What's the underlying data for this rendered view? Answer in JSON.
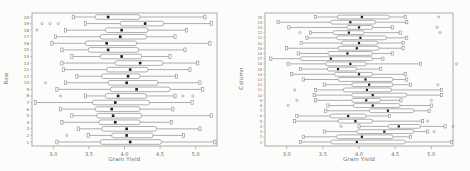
{
  "style": {
    "line_color": "#8c8c8c",
    "median_color": "#1c1c1c",
    "text_color": "#6e6e6e",
    "frame_color": "#9a9a9a",
    "box_fill": "#ffffff",
    "background": "#fcfcfb"
  },
  "chart_data": [
    {
      "type": "boxplot",
      "orientation": "horizontal",
      "xlabel": "Grain Yield",
      "ylabel": "Row",
      "xlim": [
        2.7,
        5.3
      ],
      "xticks": [
        3.0,
        3.5,
        4.0,
        4.5,
        5.0
      ],
      "categories": [
        1,
        2,
        3,
        4,
        5,
        6,
        7,
        8,
        9,
        10,
        11,
        12,
        13,
        14,
        15,
        16,
        17,
        18,
        19,
        20
      ],
      "boxes": [
        {
          "cat": 1,
          "lo": 3.05,
          "q1": 3.66,
          "med": 4.08,
          "q3": 4.52,
          "hi": 5.27,
          "outliers": []
        },
        {
          "cat": 2,
          "lo": 3.49,
          "q1": 3.82,
          "med": 4.03,
          "q3": 4.4,
          "hi": 4.83,
          "outliers": [
            3.19
          ]
        },
        {
          "cat": 3,
          "lo": 3.35,
          "q1": 3.68,
          "med": 4.03,
          "q3": 4.45,
          "hi": 5.06,
          "outliers": []
        },
        {
          "cat": 4,
          "lo": 3.12,
          "q1": 3.64,
          "med": 3.87,
          "q3": 4.22,
          "hi": 4.66,
          "outliers": []
        },
        {
          "cat": 5,
          "lo": 3.26,
          "q1": 3.61,
          "med": 3.84,
          "q3": 4.24,
          "hi": 5.22,
          "outliers": []
        },
        {
          "cat": 6,
          "lo": 3.1,
          "q1": 3.59,
          "med": 3.82,
          "q3": 4.22,
          "hi": 4.68,
          "outliers": []
        },
        {
          "cat": 7,
          "lo": 2.75,
          "q1": 3.55,
          "med": 3.87,
          "q3": 4.35,
          "hi": 4.95,
          "outliers": []
        },
        {
          "cat": 8,
          "lo": 3.45,
          "q1": 3.73,
          "med": 3.91,
          "q3": 4.31,
          "hi": 4.71,
          "outliers": [
            3.1,
            4.82,
            4.96
          ]
        },
        {
          "cat": 9,
          "lo": 3.05,
          "q1": 3.8,
          "med": 4.17,
          "q3": 4.64,
          "hi": 5.1,
          "outliers": []
        },
        {
          "cat": 10,
          "lo": 3.17,
          "q1": 3.77,
          "med": 4.03,
          "q3": 4.47,
          "hi": 5.06,
          "outliers": [
            2.89
          ]
        },
        {
          "cat": 11,
          "lo": 3.33,
          "q1": 3.68,
          "med": 4.05,
          "q3": 4.22,
          "hi": 4.73,
          "outliers": []
        },
        {
          "cat": 12,
          "lo": 3.14,
          "q1": 3.75,
          "med": 4.08,
          "q3": 4.33,
          "hi": 4.92,
          "outliers": []
        },
        {
          "cat": 13,
          "lo": 3.12,
          "q1": 3.87,
          "med": 4.22,
          "q3": 4.54,
          "hi": 5.03,
          "outliers": []
        },
        {
          "cat": 14,
          "lo": 3.26,
          "q1": 3.66,
          "med": 3.96,
          "q3": 4.24,
          "hi": 4.64,
          "outliers": []
        },
        {
          "cat": 15,
          "lo": 3.12,
          "q1": 3.49,
          "med": 3.77,
          "q3": 4.2,
          "hi": 4.85,
          "outliers": []
        },
        {
          "cat": 16,
          "lo": 2.98,
          "q1": 3.45,
          "med": 3.75,
          "q3": 4.17,
          "hi": 5.2,
          "outliers": []
        },
        {
          "cat": 17,
          "lo": 3.03,
          "q1": 3.66,
          "med": 3.94,
          "q3": 4.31,
          "hi": 4.71,
          "outliers": []
        },
        {
          "cat": 18,
          "lo": 3.17,
          "q1": 3.73,
          "med": 3.96,
          "q3": 4.33,
          "hi": 4.87,
          "outliers": [
            2.77
          ]
        },
        {
          "cat": 19,
          "lo": 3.45,
          "q1": 3.94,
          "med": 4.29,
          "q3": 4.55,
          "hi": 5.22,
          "outliers": [
            2.84,
            2.95,
            3.07
          ]
        },
        {
          "cat": 20,
          "lo": 3.28,
          "q1": 3.59,
          "med": 3.77,
          "q3": 4.22,
          "hi": 5.13,
          "outliers": []
        }
      ]
    },
    {
      "type": "boxplot",
      "orientation": "horizontal",
      "xlabel": "Grain Yield",
      "ylabel": "Column",
      "xlim": [
        2.7,
        5.3
      ],
      "xticks": [
        3.0,
        3.5,
        4.0,
        4.5,
        5.0
      ],
      "categories": [
        1,
        2,
        3,
        4,
        5,
        6,
        7,
        8,
        9,
        10,
        11,
        12,
        13,
        14,
        15,
        16,
        17,
        18,
        19,
        20,
        21,
        22,
        23,
        24,
        25
      ],
      "boxes": [
        {
          "cat": 1,
          "lo": 3.19,
          "q1": 3.61,
          "med": 3.97,
          "q3": 4.64,
          "hi": 5.28,
          "outliers": []
        },
        {
          "cat": 2,
          "lo": 3.23,
          "q1": 3.69,
          "med": 4.04,
          "q3": 4.47,
          "hi": 4.71,
          "outliers": []
        },
        {
          "cat": 3,
          "lo": 3.52,
          "q1": 3.97,
          "med": 4.35,
          "q3": 4.76,
          "hi": 4.95,
          "outliers": [
            5.04
          ]
        },
        {
          "cat": 4,
          "lo": 4.0,
          "q1": 4.4,
          "med": 4.55,
          "q3": 4.85,
          "hi": 5.19,
          "outliers": [
            3.75,
            5.3
          ]
        },
        {
          "cat": 5,
          "lo": 3.11,
          "q1": 3.71,
          "med": 3.95,
          "q3": 4.19,
          "hi": 4.88,
          "outliers": [
            4.95
          ]
        },
        {
          "cat": 6,
          "lo": 3.14,
          "q1": 3.6,
          "med": 3.85,
          "q3": 4.1,
          "hi": 4.42,
          "outliers": []
        },
        {
          "cat": 7,
          "lo": 3.54,
          "q1": 4.14,
          "med": 4.4,
          "q3": 4.76,
          "hi": 4.97,
          "outliers": []
        },
        {
          "cat": 8,
          "lo": 3.57,
          "q1": 3.92,
          "med": 4.19,
          "q3": 4.57,
          "hi": 5.0,
          "outliers": [
            3.02
          ]
        },
        {
          "cat": 9,
          "lo": 3.4,
          "q1": 3.9,
          "med": 4.1,
          "q3": 4.3,
          "hi": 4.58,
          "outliers": [
            3.14,
            5.0
          ]
        },
        {
          "cat": 10,
          "lo": 3.38,
          "q1": 3.9,
          "med": 4.19,
          "q3": 4.66,
          "hi": 5.14,
          "outliers": []
        },
        {
          "cat": 11,
          "lo": 3.4,
          "q1": 3.78,
          "med": 4.11,
          "q3": 4.45,
          "hi": 5.14,
          "outliers": [
            3.11
          ]
        },
        {
          "cat": 12,
          "lo": 3.52,
          "q1": 3.9,
          "med": 4.14,
          "q3": 4.47,
          "hi": 4.71,
          "outliers": [
            5.09
          ]
        },
        {
          "cat": 13,
          "lo": 3.23,
          "q1": 3.71,
          "med": 4.09,
          "q3": 4.47,
          "hi": 4.66,
          "outliers": []
        },
        {
          "cat": 14,
          "lo": 3.07,
          "q1": 3.66,
          "med": 4.0,
          "q3": 4.19,
          "hi": 4.64,
          "outliers": []
        },
        {
          "cat": 15,
          "lo": 3.19,
          "q1": 3.56,
          "med": 3.71,
          "q3": 3.97,
          "hi": 4.3,
          "outliers": []
        },
        {
          "cat": 16,
          "lo": 3.02,
          "q1": 3.54,
          "med": 3.88,
          "q3": 4.1,
          "hi": 4.85,
          "outliers": [
            5.35
          ]
        },
        {
          "cat": 17,
          "lo": 2.78,
          "q1": 3.19,
          "med": 3.61,
          "q3": 4.19,
          "hi": 4.33,
          "outliers": []
        },
        {
          "cat": 18,
          "lo": 3.16,
          "q1": 3.57,
          "med": 3.84,
          "q3": 4.19,
          "hi": 4.46,
          "outliers": []
        },
        {
          "cat": 19,
          "lo": 3.0,
          "q1": 3.71,
          "med": 3.97,
          "q3": 4.28,
          "hi": 4.61,
          "outliers": []
        },
        {
          "cat": 20,
          "lo": 3.2,
          "q1": 3.76,
          "med": 4.0,
          "q3": 4.26,
          "hi": 4.61,
          "outliers": []
        },
        {
          "cat": 21,
          "lo": 3.28,
          "q1": 3.69,
          "med": 4.02,
          "q3": 4.38,
          "hi": 4.66,
          "outliers": []
        },
        {
          "cat": 22,
          "lo": 3.33,
          "q1": 3.64,
          "med": 3.86,
          "q3": 4.07,
          "hi": 4.57,
          "outliers": [
            3.18,
            5.12
          ]
        },
        {
          "cat": 23,
          "lo": 3.03,
          "q1": 3.83,
          "med": 4.0,
          "q3": 4.19,
          "hi": 4.46,
          "outliers": [
            5.08
          ]
        },
        {
          "cat": 24,
          "lo": 2.88,
          "q1": 3.61,
          "med": 3.88,
          "q3": 4.23,
          "hi": 4.66,
          "outliers": []
        },
        {
          "cat": 25,
          "lo": 3.4,
          "q1": 3.7,
          "med": 4.04,
          "q3": 4.42,
          "hi": 4.64,
          "outliers": [
            5.1
          ]
        }
      ]
    }
  ]
}
